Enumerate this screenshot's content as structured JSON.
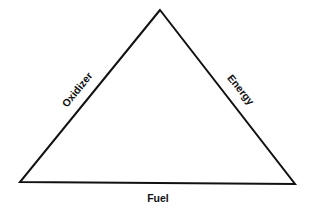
{
  "diagram": {
    "type": "fire-triangle",
    "sides": {
      "left": "Oxidizer",
      "right": "Energy",
      "bottom": "Fuel"
    },
    "line_color": "#111111",
    "background": "#ffffff"
  }
}
